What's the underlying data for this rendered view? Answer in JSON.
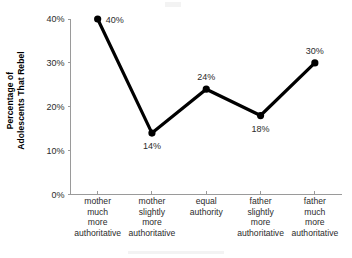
{
  "chart_data": {
    "type": "line",
    "title": "",
    "xlabel": "",
    "ylabel": "Percentage of Adolescents That Rebel",
    "ylabel_line1": "Percentage of",
    "ylabel_line2": "Adolescents That Rebel",
    "categories": [
      "mother much more authoritative",
      "mother slightly more authoritative",
      "equal authority",
      "father slightly more authoritative",
      "father much more authoritative"
    ],
    "category_lines": [
      [
        "mother",
        "much",
        "more",
        "authoritative"
      ],
      [
        "mother",
        "slightly",
        "more",
        "authoritative"
      ],
      [
        "equal",
        "authority"
      ],
      [
        "father",
        "slightly",
        "more",
        "authoritative"
      ],
      [
        "father",
        "much",
        "more",
        "authoritative"
      ]
    ],
    "values": [
      40,
      14,
      24,
      18,
      30
    ],
    "point_labels": [
      "40%",
      "14%",
      "24%",
      "18%",
      "30%"
    ],
    "point_label_positions": [
      "right",
      "below",
      "above",
      "below",
      "above"
    ],
    "ylim": [
      0,
      40
    ],
    "ytick_values": [
      0,
      10,
      20,
      30,
      40
    ],
    "ytick_labels": [
      "0%",
      "10%",
      "20%",
      "30%",
      "40%"
    ],
    "grid": false,
    "legend": false,
    "marker": "filled-circle",
    "line_color": "#000000",
    "axis_color": "#9a9a9a",
    "text_color": "#2b2b2b",
    "background": "#ffffff"
  }
}
